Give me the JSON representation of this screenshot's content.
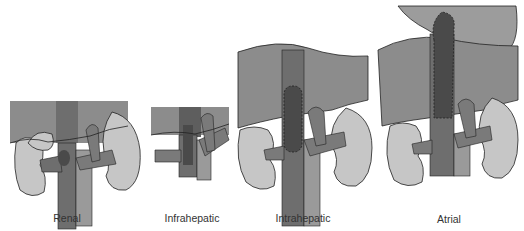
{
  "diagram": {
    "type": "medical-illustration",
    "panels": [
      {
        "id": "renal",
        "label": "Renal",
        "label_x": 67
      },
      {
        "id": "infrahepatic",
        "label": "Infrahepatic",
        "label_x": 192
      },
      {
        "id": "intrahepatic",
        "label": "Intrahepatic",
        "label_x": 303
      },
      {
        "id": "atrial",
        "label": "Atrial",
        "label_x": 449
      }
    ],
    "colors": {
      "liver": "#8c8c8c",
      "ivc": "#6e6e6e",
      "thrombus": "#4a4a4a",
      "kidney": "#c6c6c6",
      "aorta": "#9a9a9a",
      "outline": "#222222",
      "heart": "#9c9c9c"
    }
  }
}
